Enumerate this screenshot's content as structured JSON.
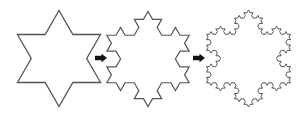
{
  "diagram": {
    "background": "#ffffff",
    "stroke_color": "#555555",
    "arrow_color": "#111111",
    "snowflakes": [
      {
        "id": "iteration-1",
        "order": 1,
        "cx": 59,
        "cy": 58.5,
        "radius": 48,
        "stroke_width": 1.3
      },
      {
        "id": "iteration-2",
        "order": 2,
        "cx": 148,
        "cy": 59,
        "radius": 47.5,
        "stroke_width": 1.2
      },
      {
        "id": "iteration-3",
        "order": 3,
        "cx": 248.5,
        "cy": 58.5,
        "radius": 48.5,
        "stroke_width": 1.0
      }
    ],
    "arrows": [
      {
        "id": "arrow-1-to-2",
        "x": 95,
        "y": 58,
        "length": 12,
        "direction": "right"
      },
      {
        "id": "arrow-2-to-3",
        "x": 193,
        "y": 58,
        "length": 12,
        "direction": "right"
      }
    ]
  }
}
